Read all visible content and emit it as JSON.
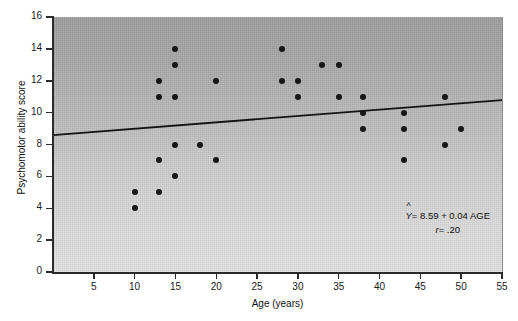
{
  "figure": {
    "background_color": "#ffffff",
    "plot_fill_top": "#9e9e9e",
    "plot_fill_bottom": "#e2e2e2",
    "point_color": "#161616",
    "line_color": "#141414"
  },
  "annotation": {
    "equation": "= 8.59 + 0.04 AGE",
    "y_symbol": "Y",
    "hat_symbol": "^",
    "correlation_label": "r",
    "correlation_value": "= .20"
  },
  "chart_data": {
    "type": "scatter",
    "title": "",
    "xlabel": "Age (years)",
    "ylabel": "Psychomotor ability score",
    "xlim": [
      0,
      55
    ],
    "ylim": [
      0,
      16
    ],
    "xticks": [
      5,
      10,
      15,
      20,
      25,
      30,
      35,
      40,
      45,
      50,
      55
    ],
    "xtick_labels": [
      "5",
      "10",
      "15",
      "20",
      "25",
      "30",
      "35",
      "40",
      "45",
      "50",
      "55"
    ],
    "yticks": [
      0,
      2,
      4,
      6,
      8,
      10,
      12,
      14,
      16
    ],
    "ytick_labels": [
      "0",
      "2",
      "4",
      "6",
      "8",
      "10",
      "12",
      "14",
      "16"
    ],
    "grid": false,
    "legend": "none",
    "points": [
      {
        "x": 10,
        "y": 5
      },
      {
        "x": 10,
        "y": 4
      },
      {
        "x": 13,
        "y": 12
      },
      {
        "x": 13,
        "y": 11
      },
      {
        "x": 13,
        "y": 7
      },
      {
        "x": 13,
        "y": 5
      },
      {
        "x": 15,
        "y": 14
      },
      {
        "x": 15,
        "y": 13
      },
      {
        "x": 15,
        "y": 11
      },
      {
        "x": 15,
        "y": 8
      },
      {
        "x": 15,
        "y": 6
      },
      {
        "x": 18,
        "y": 8
      },
      {
        "x": 20,
        "y": 12
      },
      {
        "x": 20,
        "y": 7
      },
      {
        "x": 28,
        "y": 14
      },
      {
        "x": 28,
        "y": 12
      },
      {
        "x": 30,
        "y": 12
      },
      {
        "x": 30,
        "y": 11
      },
      {
        "x": 33,
        "y": 13
      },
      {
        "x": 35,
        "y": 13
      },
      {
        "x": 35,
        "y": 11
      },
      {
        "x": 38,
        "y": 11
      },
      {
        "x": 38,
        "y": 10
      },
      {
        "x": 38,
        "y": 9
      },
      {
        "x": 43,
        "y": 10
      },
      {
        "x": 43,
        "y": 9
      },
      {
        "x": 43,
        "y": 7
      },
      {
        "x": 48,
        "y": 11
      },
      {
        "x": 48,
        "y": 8
      },
      {
        "x": 50,
        "y": 9
      }
    ],
    "fit_line": {
      "intercept": 8.59,
      "slope": 0.04,
      "x_start": 0,
      "x_end": 55,
      "y_start": 8.59,
      "y_end": 10.79,
      "r": 0.2
    }
  }
}
